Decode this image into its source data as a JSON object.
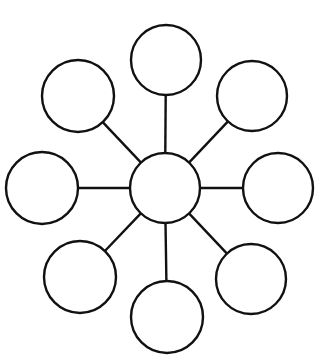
{
  "diagram": {
    "type": "hub-and-spoke",
    "stroke_color": "#111111",
    "background_color": "#ffffff",
    "hub": {
      "id": "center",
      "cx": 165,
      "cy": 188,
      "r": 35,
      "label": ""
    },
    "satellites": [
      {
        "id": "top",
        "cx": 166,
        "cy": 60,
        "r": 35,
        "label": ""
      },
      {
        "id": "top-right",
        "cx": 252,
        "cy": 96,
        "r": 35,
        "label": ""
      },
      {
        "id": "right",
        "cx": 278,
        "cy": 188,
        "r": 35,
        "label": ""
      },
      {
        "id": "bottom-right",
        "cx": 251,
        "cy": 279,
        "r": 35,
        "label": ""
      },
      {
        "id": "bottom",
        "cx": 167,
        "cy": 317,
        "r": 36,
        "label": ""
      },
      {
        "id": "bottom-left",
        "cx": 80,
        "cy": 277,
        "r": 36,
        "label": ""
      },
      {
        "id": "left",
        "cx": 42,
        "cy": 188,
        "r": 36,
        "label": ""
      },
      {
        "id": "top-left",
        "cx": 78,
        "cy": 96,
        "r": 36,
        "label": ""
      }
    ]
  }
}
